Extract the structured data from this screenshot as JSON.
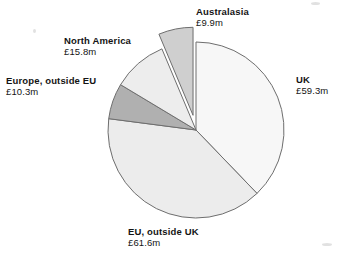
{
  "chart_data": {
    "type": "pie",
    "title": "",
    "unit": "£m",
    "currency_symbol": "£",
    "total": 156.9,
    "categories": [
      "UK",
      "EU, outside UK",
      "Europe, outside EU",
      "North America",
      "Australasia"
    ],
    "values": [
      59.3,
      61.6,
      10.3,
      15.8,
      9.9
    ],
    "value_labels": [
      "£59.3m",
      "£61.6m",
      "£10.3m",
      "£15.8m",
      "£9.9m"
    ],
    "percentages": [
      37.8,
      39.3,
      6.6,
      10.1,
      6.3
    ],
    "legend": "none",
    "grid": false,
    "slices": [
      {
        "name": "UK",
        "value": 59.3,
        "value_label": "£59.3m",
        "percent": 37.8,
        "fill": "#f7f7f7",
        "stroke": "#6e6e6e",
        "exploded": false,
        "start_angle": 0,
        "end_angle": 136.1
      },
      {
        "name": "EU, outside UK",
        "value": 61.6,
        "value_label": "£61.6m",
        "percent": 39.3,
        "fill": "#ececec",
        "stroke": "#6e6e6e",
        "exploded": false,
        "start_angle": 136.1,
        "end_angle": 277.4
      },
      {
        "name": "Europe, outside EU",
        "value": 10.3,
        "value_label": "£10.3m",
        "percent": 6.6,
        "fill": "#b0b0b0",
        "stroke": "#6e6e6e",
        "exploded": false,
        "start_angle": 277.4,
        "end_angle": 301.0
      },
      {
        "name": "North America",
        "value": 15.8,
        "value_label": "£15.8m",
        "percent": 10.1,
        "fill": "#ededed",
        "stroke": "#6e6e6e",
        "exploded": false,
        "start_angle": 301.0,
        "end_angle": 337.2
      },
      {
        "name": "Australasia",
        "value": 9.9,
        "value_label": "£9.9m",
        "percent": 6.3,
        "fill": "#cfcfcf",
        "stroke": "#6e6e6e",
        "exploded": true,
        "start_angle": 337.2,
        "end_angle": 360.0
      }
    ]
  },
  "labels": {
    "uk": {
      "name": "UK",
      "value": "£59.3m"
    },
    "eu_outside_uk": {
      "name": "EU, outside UK",
      "value": "£61.6m"
    },
    "europe_outside_eu": {
      "name": "Europe, outside EU",
      "value": "£10.3m"
    },
    "north_america": {
      "name": "North America",
      "value": "£15.8m"
    },
    "australasia": {
      "name": "Australasia",
      "value": "£9.9m"
    }
  },
  "colors": {
    "background": "#ffffff",
    "outline": "#6e6e6e",
    "text": "#141414",
    "slice_light": "#f2f2f2",
    "slice_dark": "#b0b0b0"
  }
}
